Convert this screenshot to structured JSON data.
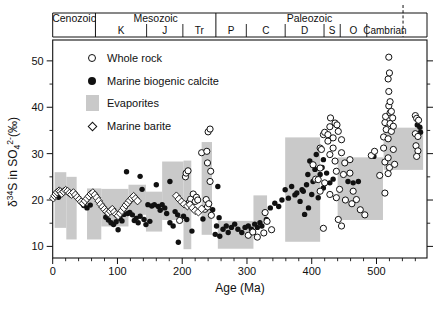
{
  "figure": {
    "legend": {
      "items": [
        {
          "marker": "open-circle",
          "label": "Whole rock"
        },
        {
          "marker": "filled-circle",
          "label": "Marine biogenic calcite"
        },
        {
          "marker": "gray-box",
          "label": "Evaporites"
        },
        {
          "marker": "open-diamond",
          "label": "Marine barite"
        }
      ]
    },
    "geo_timescale": {
      "eras": [
        {
          "label": "Cenozoic",
          "start": 0,
          "end": 66
        },
        {
          "label": "Mesozoic",
          "start": 66,
          "end": 252
        },
        {
          "label": "Paleozoic",
          "start": 252,
          "end": 541
        }
      ],
      "periods": [
        {
          "label": "K",
          "start": 66,
          "end": 145
        },
        {
          "label": "J",
          "start": 145,
          "end": 201
        },
        {
          "label": "Tr",
          "start": 201,
          "end": 252
        },
        {
          "label": "P",
          "start": 252,
          "end": 299
        },
        {
          "label": "C",
          "start": 299,
          "end": 359
        },
        {
          "label": "D",
          "start": 359,
          "end": 419
        },
        {
          "label": "S",
          "start": 419,
          "end": 444
        },
        {
          "label": "O",
          "start": 444,
          "end": 485
        },
        {
          "label": "Cambrian",
          "start": 485,
          "end": 541
        }
      ],
      "dashed_boundary_age": 541,
      "bar_end_age": 578
    }
  },
  "chart_data": {
    "type": "scatter",
    "title": "",
    "xlabel": "Age (Ma)",
    "ylabel": "δ34S in SO42-(‰)",
    "ylabel_parts": [
      {
        "t": "δ"
      },
      {
        "t": "34",
        "sup": true
      },
      {
        "t": "S in SO"
      },
      {
        "t": "4",
        "sub": true
      },
      {
        "t": "2-",
        "sup": true
      },
      {
        "t": "(‰)"
      }
    ],
    "xlim": [
      0,
      578
    ],
    "ylim": [
      7.5,
      54.5
    ],
    "x_major_ticks": [
      0,
      100,
      200,
      300,
      400,
      500
    ],
    "x_minor_step": 20,
    "y_major_ticks": [
      10,
      20,
      30,
      40,
      50
    ],
    "y_minor_step": 5,
    "grid": false,
    "legend_position": "upper-left-inside",
    "colors": {
      "points": "#111111",
      "evaporite": "#c9c9c9",
      "axis": "#111111",
      "background": "#ffffff"
    },
    "evaporite_boxes": [
      [
        3,
        21,
        14,
        26
      ],
      [
        21,
        37,
        11.5,
        25
      ],
      [
        53,
        75,
        11.5,
        22.5
      ],
      [
        75,
        117,
        14.3,
        22.4
      ],
      [
        117,
        144,
        16.8,
        23.3
      ],
      [
        144,
        169,
        13.2,
        21.8
      ],
      [
        169,
        202,
        15.7,
        28.3
      ],
      [
        202,
        214,
        9.4,
        28.5
      ],
      [
        230,
        246,
        12.5,
        32.5
      ],
      [
        255,
        310,
        9.5,
        15.5
      ],
      [
        310,
        331,
        15,
        21
      ],
      [
        359,
        413,
        11,
        33.5
      ],
      [
        440,
        510,
        15.7,
        29.2
      ],
      [
        511,
        572,
        26.5,
        35.6
      ]
    ],
    "series": [
      {
        "name": "Whole rock",
        "marker": "open-circle",
        "points": [
          [
            196,
            15.6
          ],
          [
            205,
            25.0
          ],
          [
            206,
            25.8
          ],
          [
            209,
            26.3
          ],
          [
            211,
            19.5
          ],
          [
            213,
            20.2
          ],
          [
            217,
            21.3
          ],
          [
            220,
            19.7
          ],
          [
            222,
            20.6
          ],
          [
            224,
            20.0
          ],
          [
            230,
            30.2
          ],
          [
            235,
            18.0
          ],
          [
            237,
            20.1
          ],
          [
            238,
            30.5
          ],
          [
            239,
            28.0
          ],
          [
            239,
            18.5
          ],
          [
            240,
            34.7
          ],
          [
            241,
            19.2
          ],
          [
            243,
            24.0
          ],
          [
            243,
            35.3
          ],
          [
            244,
            26.2
          ],
          [
            245,
            16.7
          ],
          [
            302,
            12.4
          ],
          [
            309,
            13.1
          ],
          [
            316,
            12.0
          ],
          [
            326,
            12.9
          ],
          [
            328,
            17.3
          ],
          [
            331,
            15.4
          ],
          [
            338,
            13.6
          ],
          [
            402,
            27.6
          ],
          [
            406,
            24.5
          ],
          [
            410,
            24.4
          ],
          [
            413,
            26.9
          ],
          [
            413,
            31.2
          ],
          [
            413,
            21.9
          ],
          [
            415,
            30.9
          ],
          [
            418,
            34.1
          ],
          [
            418,
            13.9
          ],
          [
            420,
            23.7
          ],
          [
            420,
            34.6
          ],
          [
            425,
            32.7
          ],
          [
            425,
            34.1
          ],
          [
            428,
            29.8
          ],
          [
            428,
            35.8
          ],
          [
            428,
            21.2
          ],
          [
            429,
            37.7
          ],
          [
            433,
            33.4
          ],
          [
            433,
            31.2
          ],
          [
            436,
            28.4
          ],
          [
            436,
            36.6
          ],
          [
            438,
            26.2
          ],
          [
            438,
            20.5
          ],
          [
            439,
            36.2
          ],
          [
            441,
            34.8
          ],
          [
            441,
            15.8
          ],
          [
            443,
            22.3
          ],
          [
            446,
            33.0
          ],
          [
            446,
            30.2
          ],
          [
            446,
            14.4
          ],
          [
            449,
            25.5
          ],
          [
            451,
            28.0
          ],
          [
            452,
            20.0
          ],
          [
            459,
            28.7
          ],
          [
            459,
            25.8
          ],
          [
            462,
            19.2
          ],
          [
            464,
            21.9
          ],
          [
            469,
            20.1
          ],
          [
            475,
            17.9
          ],
          [
            482,
            16.8
          ],
          [
            492,
            29.6
          ],
          [
            497,
            30.5
          ],
          [
            505,
            25.3
          ],
          [
            511,
            33.6
          ],
          [
            511,
            31.2
          ],
          [
            513,
            36.7
          ],
          [
            513,
            28.2
          ],
          [
            513,
            21.5
          ],
          [
            514,
            38.0
          ],
          [
            515,
            35.2
          ],
          [
            518,
            46.1
          ],
          [
            518,
            33.2
          ],
          [
            518,
            29.1
          ],
          [
            518,
            25.7
          ],
          [
            519,
            50.8
          ],
          [
            519,
            43.4
          ],
          [
            519,
            40.3
          ],
          [
            520,
            47.4
          ],
          [
            520,
            27.0
          ],
          [
            521,
            41.2
          ],
          [
            521,
            36.5
          ],
          [
            521,
            38.8
          ],
          [
            523,
            34.8
          ],
          [
            523,
            39.1
          ],
          [
            525,
            37.7
          ],
          [
            526,
            35.9
          ],
          [
            526,
            30.9
          ],
          [
            528,
            27.7
          ],
          [
            560,
            38.2
          ],
          [
            562,
            37.6
          ],
          [
            565,
            37.2
          ],
          [
            560,
            34.3
          ],
          [
            564,
            33.7
          ],
          [
            561,
            31.7
          ],
          [
            564,
            30.6
          ],
          [
            562,
            29.4
          ]
        ]
      },
      {
        "name": "Marine biogenic calcite",
        "marker": "filled-circle",
        "points": [
          [
            4,
            21.2
          ],
          [
            9,
            20.6
          ],
          [
            48,
            18.8
          ],
          [
            53,
            18.3
          ],
          [
            58,
            18.9
          ],
          [
            82,
            16.3
          ],
          [
            86,
            15.7
          ],
          [
            90,
            15.1
          ],
          [
            94,
            14.7
          ],
          [
            98,
            15.3
          ],
          [
            101,
            13.6
          ],
          [
            104,
            16.0
          ],
          [
            107,
            15.5
          ],
          [
            110,
            16.9
          ],
          [
            114,
            26.1
          ],
          [
            116,
            17.1
          ],
          [
            119,
            17.3
          ],
          [
            123,
            16.8
          ],
          [
            126,
            15.6
          ],
          [
            129,
            16.1
          ],
          [
            132,
            15.1
          ],
          [
            135,
            25.1
          ],
          [
            135,
            16.5
          ],
          [
            138,
            22.3
          ],
          [
            141,
            15.8
          ],
          [
            144,
            14.7
          ],
          [
            147,
            19.0
          ],
          [
            150,
            15.4
          ],
          [
            153,
            18.7
          ],
          [
            157,
            19.0
          ],
          [
            160,
            23.3
          ],
          [
            163,
            18.6
          ],
          [
            166,
            17.8
          ],
          [
            169,
            19.0
          ],
          [
            173,
            18.3
          ],
          [
            176,
            17.1
          ],
          [
            181,
            24.0
          ],
          [
            181,
            15.1
          ],
          [
            186,
            14.4
          ],
          [
            189,
            17.5
          ],
          [
            193,
            16.8
          ],
          [
            194,
            10.9
          ],
          [
            197,
            15.8
          ],
          [
            202,
            16.5
          ],
          [
            207,
            15.8
          ],
          [
            215,
            13.3
          ],
          [
            232,
            15.9
          ],
          [
            247,
            17.9
          ],
          [
            251,
            12.6
          ],
          [
            253,
            14.4
          ],
          [
            255,
            22.9
          ],
          [
            257,
            16.2
          ],
          [
            258,
            12.2
          ],
          [
            263,
            13.7
          ],
          [
            268,
            14.4
          ],
          [
            271,
            13.0
          ],
          [
            276,
            14.1
          ],
          [
            281,
            14.8
          ],
          [
            286,
            13.7
          ],
          [
            292,
            13.0
          ],
          [
            297,
            14.1
          ],
          [
            302,
            14.4
          ],
          [
            307,
            13.7
          ],
          [
            312,
            14.8
          ],
          [
            316,
            14.1
          ],
          [
            320,
            15.1
          ],
          [
            323,
            14.4
          ],
          [
            330,
            15.8
          ],
          [
            336,
            18.3
          ],
          [
            343,
            19.3
          ],
          [
            349,
            18.6
          ],
          [
            354,
            20.0
          ],
          [
            359,
            22.2
          ],
          [
            364,
            20.4
          ],
          [
            369,
            22.9
          ],
          [
            374,
            21.1
          ],
          [
            377,
            21.5
          ],
          [
            382,
            19.7
          ],
          [
            385,
            22.2
          ],
          [
            387,
            21.9
          ],
          [
            389,
            16.9
          ],
          [
            392,
            23.3
          ],
          [
            394,
            25.5
          ],
          [
            395,
            18.3
          ],
          [
            397,
            28.4
          ],
          [
            400,
            21.2
          ],
          [
            402,
            24.0
          ],
          [
            405,
            26.6
          ],
          [
            407,
            29.8
          ],
          [
            410,
            20.5
          ],
          [
            413,
            25.5
          ],
          [
            416,
            27.0
          ],
          [
            418,
            28.7
          ],
          [
            418,
            22.6
          ],
          [
            423,
            25.8
          ],
          [
            428,
            23.7
          ],
          [
            433,
            24.5
          ],
          [
            456,
            24.0
          ],
          [
            464,
            23.7
          ],
          [
            472,
            24.0
          ],
          [
            496,
            29.4
          ],
          [
            563,
            36.2
          ],
          [
            567,
            35.7
          ],
          [
            568,
            34.6
          ]
        ]
      },
      {
        "name": "Marine barite",
        "marker": "open-diamond",
        "points": [
          [
            1,
            20.4
          ],
          [
            3,
            20.9
          ],
          [
            5,
            21.3
          ],
          [
            7,
            21.7
          ],
          [
            10,
            22.0
          ],
          [
            12,
            21.8
          ],
          [
            14,
            21.4
          ],
          [
            17,
            21.8
          ],
          [
            20,
            22.1
          ],
          [
            23,
            21.9
          ],
          [
            26,
            21.5
          ],
          [
            29,
            21.2
          ],
          [
            32,
            21.6
          ],
          [
            35,
            21.1
          ],
          [
            38,
            20.6
          ],
          [
            41,
            20.1
          ],
          [
            44,
            19.6
          ],
          [
            47,
            19.3
          ],
          [
            50,
            19.8
          ],
          [
            53,
            20.3
          ],
          [
            56,
            20.8
          ],
          [
            59,
            21.3
          ],
          [
            62,
            21.6
          ],
          [
            65,
            21.1
          ],
          [
            68,
            20.5
          ],
          [
            71,
            19.8
          ],
          [
            74,
            19.1
          ],
          [
            77,
            18.5
          ],
          [
            80,
            18.0
          ],
          [
            83,
            17.5
          ],
          [
            86,
            17.2
          ],
          [
            89,
            17.6
          ],
          [
            92,
            18.0
          ],
          [
            95,
            17.4
          ],
          [
            98,
            16.9
          ],
          [
            101,
            16.6
          ],
          [
            104,
            17.1
          ],
          [
            107,
            17.7
          ],
          [
            110,
            18.3
          ],
          [
            113,
            18.9
          ],
          [
            116,
            19.4
          ],
          [
            119,
            19.9
          ],
          [
            122,
            20.4
          ],
          [
            125,
            20.8
          ],
          [
            128,
            20.3
          ],
          [
            131,
            19.8
          ],
          [
            191,
            20.9
          ],
          [
            195,
            20.2
          ],
          [
            199,
            19.6
          ],
          [
            203,
            19.1
          ],
          [
            208,
            18.7
          ],
          [
            212,
            19.0
          ],
          [
            216,
            18.3
          ],
          [
            220,
            17.7
          ],
          [
            225,
            17.4
          ],
          [
            230,
            18.1
          ]
        ]
      }
    ]
  }
}
